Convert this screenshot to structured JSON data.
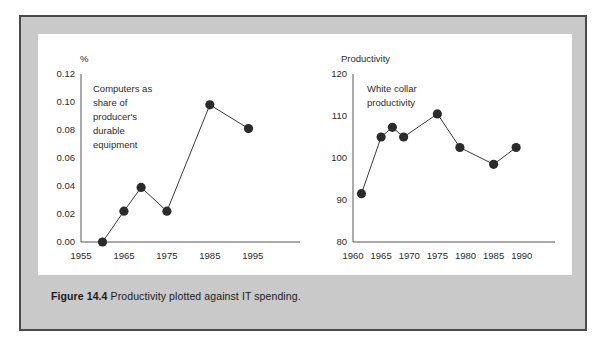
{
  "figure": {
    "caption_label": "Figure 14.4",
    "caption_text": "Productivity plotted against IT spending."
  },
  "colors": {
    "frame_border": "#4a4a4a",
    "frame_fill": "#c9c9c9",
    "panel_fill": "#ffffff",
    "line": "#3a3a3a",
    "marker": "#2b2b2b",
    "axis": "#555555",
    "text": "#2b2b2b"
  },
  "chart_data": [
    {
      "type": "line",
      "id": "it-spending",
      "title": "",
      "ylabel": "%",
      "xlabel": "",
      "annotation": "Computers as share of producer's durable equipment",
      "annotation_lines": [
        "Computers as",
        "share of",
        "producer's",
        "durable",
        "equipment"
      ],
      "grid": false,
      "legend": "none",
      "xlim": [
        1955,
        1999
      ],
      "ylim": [
        0.0,
        0.12
      ],
      "xticks": [
        1955,
        1965,
        1975,
        1985,
        1995
      ],
      "xtick_labels": [
        "1955",
        "1965",
        "1975",
        "1985",
        "1995"
      ],
      "yticks": [
        0.0,
        0.02,
        0.04,
        0.06,
        0.08,
        0.1,
        0.12
      ],
      "ytick_labels": [
        "0.00",
        "0.02",
        "0.04",
        "0.06",
        "0.08",
        "0.10",
        "0.12"
      ],
      "x": [
        1960,
        1965,
        1969,
        1975,
        1985,
        1994
      ],
      "values": [
        0.0,
        0.022,
        0.039,
        0.022,
        0.098,
        0.081
      ]
    },
    {
      "type": "line",
      "id": "white-collar-productivity",
      "title": "",
      "ylabel": "Productivity",
      "xlabel": "",
      "annotation": "White collar productivity",
      "annotation_lines": [
        "White collar",
        "productivity"
      ],
      "grid": false,
      "legend": "none",
      "xlim": [
        1960,
        1992
      ],
      "ylim": [
        80,
        120
      ],
      "xticks": [
        1960,
        1965,
        1970,
        1975,
        1980,
        1985,
        1990
      ],
      "xtick_labels": [
        "1960",
        "1965",
        "1970",
        "1975",
        "1980",
        "1985",
        "1990"
      ],
      "yticks": [
        80,
        90,
        100,
        110,
        120
      ],
      "ytick_labels": [
        "80",
        "90",
        "100",
        "110",
        "120"
      ],
      "x": [
        1961.5,
        1965,
        1967,
        1969,
        1975,
        1979,
        1985,
        1989
      ],
      "values": [
        91.5,
        105.0,
        107.3,
        105.0,
        110.5,
        102.5,
        98.5,
        102.5
      ]
    }
  ]
}
